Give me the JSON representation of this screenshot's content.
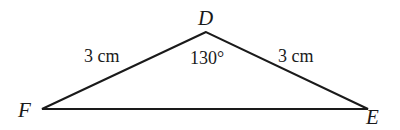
{
  "diagram": {
    "type": "triangle",
    "vertices": {
      "D": {
        "label": "D",
        "x": 206,
        "y": 32
      },
      "F": {
        "label": "F",
        "x": 42,
        "y": 109
      },
      "E": {
        "label": "E",
        "x": 368,
        "y": 109
      }
    },
    "sides": {
      "DF": {
        "label": "3 cm"
      },
      "DE": {
        "label": "3 cm"
      }
    },
    "angles": {
      "D": {
        "label": "130°"
      }
    },
    "colors": {
      "stroke": "#1a1a1a",
      "background": "#ffffff"
    }
  }
}
